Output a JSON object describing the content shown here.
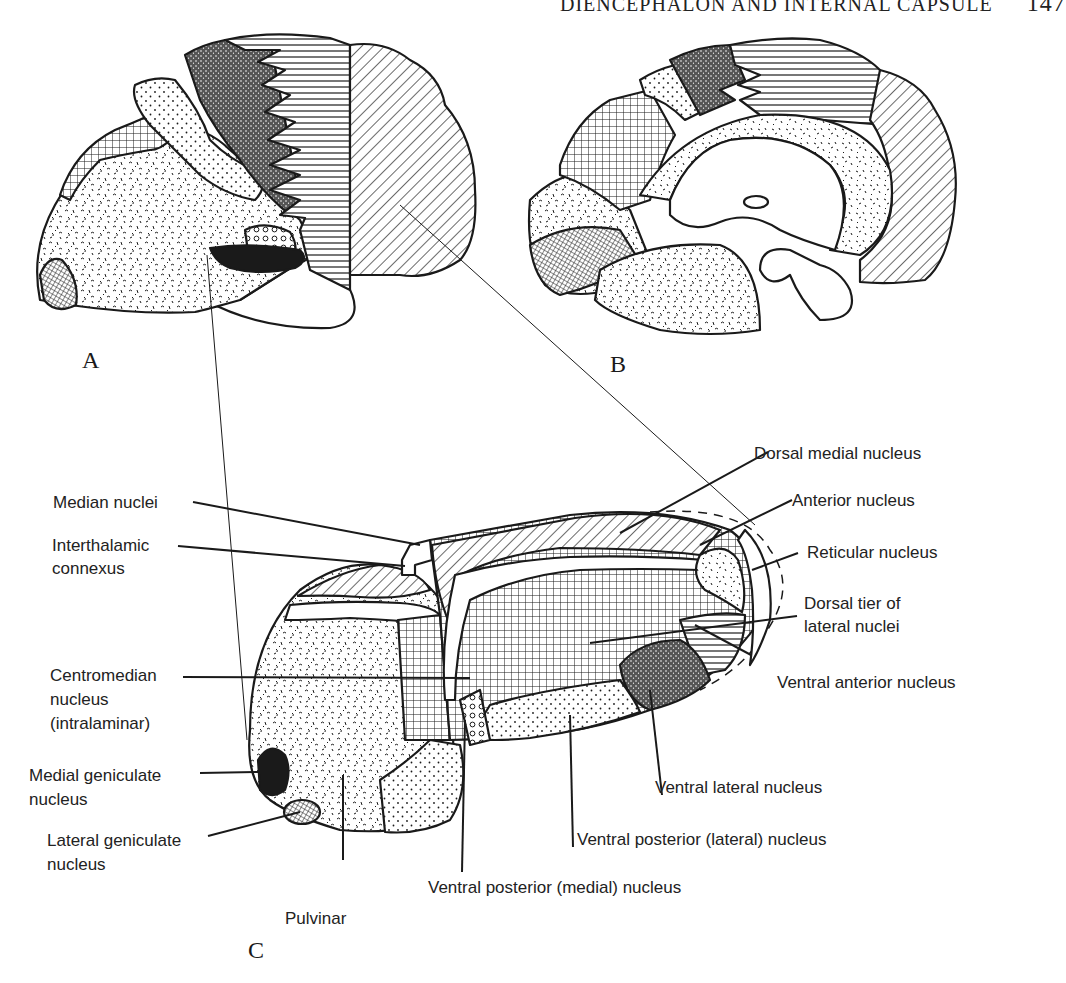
{
  "page_header": {
    "running_title": "DIENCEPHALON AND INTERNAL CAPSULE",
    "page_number": "147"
  },
  "panels": {
    "A": "A",
    "B": "B",
    "C": "C"
  },
  "labels": {
    "dorsal_medial": "Dorsal medial nucleus",
    "median_nuclei": "Median nuclei",
    "anterior": "Anterior nucleus",
    "interthalamic_1": "Interthalamic",
    "interthalamic_2": "connexus",
    "reticular": "Reticular nucleus",
    "dorsal_tier_1": "Dorsal tier of",
    "dorsal_tier_2": "lateral nuclei",
    "centromedian_1": "Centromedian",
    "centromedian_2": "nucleus",
    "centromedian_3": "(intralaminar)",
    "ventral_anterior": "Ventral anterior nucleus",
    "medial_geniculate_1": "Medial geniculate",
    "medial_geniculate_2": "nucleus",
    "ventral_lateral": "Ventral lateral nucleus",
    "lateral_geniculate_1": "Lateral geniculate",
    "lateral_geniculate_2": "nucleus",
    "ventral_posterior_lateral": "Ventral posterior (lateral) nucleus",
    "ventral_posterior_medial": "Ventral posterior (medial) nucleus",
    "pulvinar": "Pulvinar"
  },
  "colors": {
    "ink": "#1a1a1a",
    "paper": "#ffffff"
  }
}
